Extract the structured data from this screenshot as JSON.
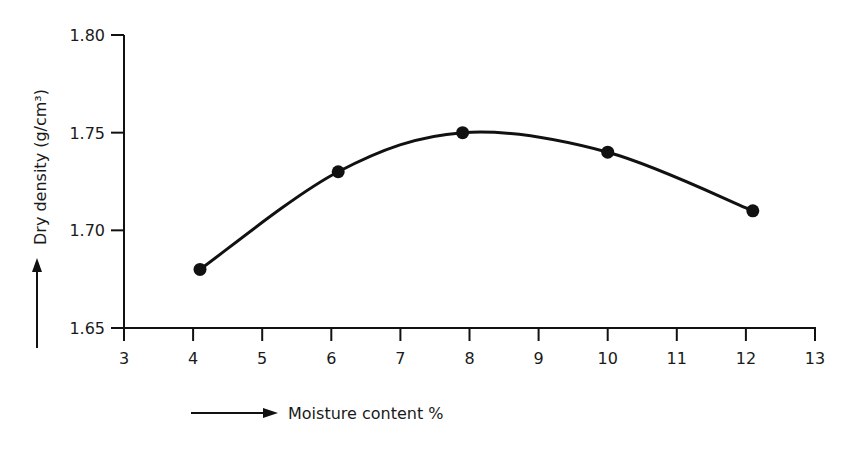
{
  "chart_data": {
    "type": "line",
    "title": "",
    "xlabel": "Moisture content %",
    "ylabel": "Dry density  (g/cm³)",
    "xlim": [
      3,
      13
    ],
    "ylim": [
      1.65,
      1.8
    ],
    "x_ticks": [
      3,
      4,
      5,
      6,
      7,
      8,
      9,
      10,
      11,
      12,
      13
    ],
    "y_ticks": [
      "1.65",
      "1.70",
      "1.75",
      "1.80"
    ],
    "grid": false,
    "legend": null,
    "series": [
      {
        "name": "Dry density",
        "x": [
          4.1,
          6.1,
          7.9,
          10.0,
          12.1
        ],
        "y": [
          1.68,
          1.73,
          1.75,
          1.74,
          1.71
        ],
        "marker": "filled-circle",
        "smooth": true
      }
    ],
    "annotations": [
      "arrow pointing right beside x-axis label",
      "arrow pointing up beside y-axis label"
    ]
  },
  "colors": {
    "line": "#111111",
    "background": "#ffffff"
  }
}
